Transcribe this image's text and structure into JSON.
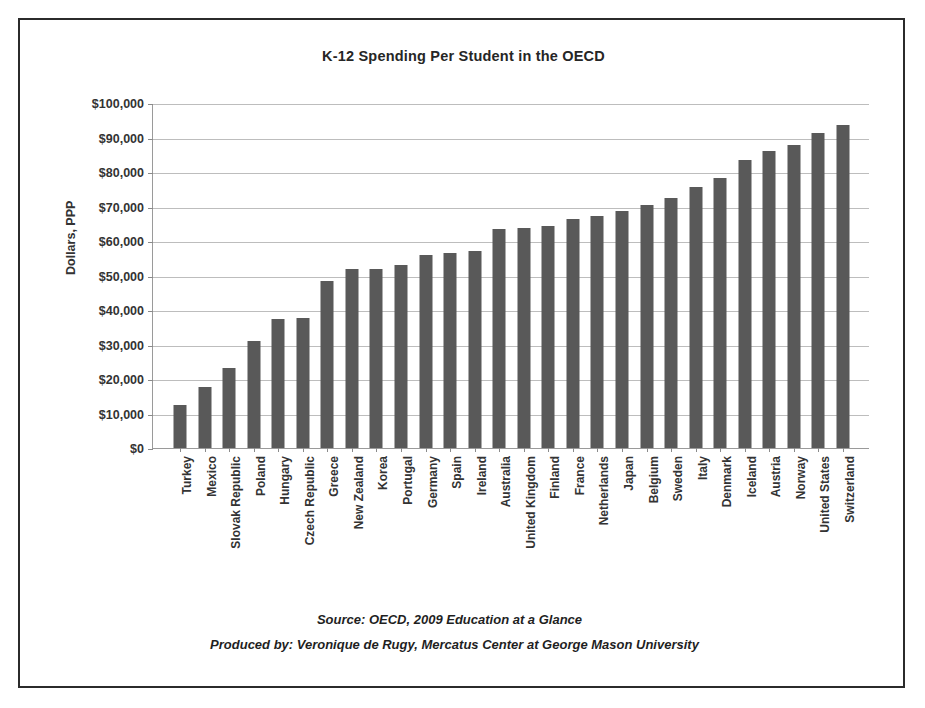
{
  "chart_data": {
    "type": "bar",
    "title": "K-12 Spending Per Student in the OECD",
    "xlabel": "",
    "ylabel": "Dollars, PPP",
    "ylim": [
      0,
      100000
    ],
    "ytick_step": 10000,
    "grid": true,
    "legend": null,
    "bar_color": "#595959",
    "ytick_labels": [
      "$100,000",
      "$90,000",
      "$80,000",
      "$70,000",
      "$60,000",
      "$50,000",
      "$40,000",
      "$30,000",
      "$20,000",
      "$10,000",
      "$0"
    ],
    "ytick_values": [
      100000,
      90000,
      80000,
      70000,
      60000,
      50000,
      40000,
      30000,
      20000,
      10000,
      0
    ],
    "categories": [
      "Turkey",
      "Mexico",
      "Slovak Republic",
      "Poland",
      "Hungary",
      "Czech Republic",
      "Greece",
      "New Zealand",
      "Korea",
      "Portugal",
      "Germany",
      "Spain",
      "Ireland",
      "Australia",
      "United Kingdom",
      "Finland",
      "France",
      "Netherlands",
      "Japan",
      "Belgium",
      "Sweden",
      "Italy",
      "Denmark",
      "Iceland",
      "Austria",
      "Norway",
      "United States",
      "Switzerland"
    ],
    "values": [
      12500,
      17700,
      23300,
      31000,
      37300,
      37800,
      48300,
      52000,
      52000,
      53100,
      56000,
      56500,
      57000,
      63400,
      63900,
      64400,
      66400,
      67300,
      68800,
      70500,
      72400,
      75600,
      78300,
      83500,
      86000,
      87800,
      91400,
      93600
    ]
  },
  "notes": {
    "source": "Source: OECD, 2009  Education at a Glance",
    "produced_by": "Produced by: Veronique de Rugy, Mercatus Center at George Mason University"
  }
}
